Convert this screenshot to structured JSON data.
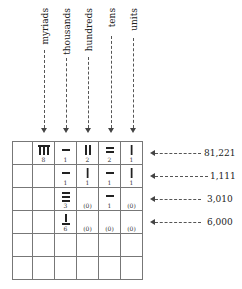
{
  "columns": [
    {
      "label": "myriads",
      "x": 43
    },
    {
      "label": "thousands",
      "x": 63
    },
    {
      "label": "hundreds",
      "x": 86
    },
    {
      "label": "tens",
      "x": 109
    },
    {
      "label": "units",
      "x": 131
    }
  ],
  "rows": [
    {
      "value": "81,221",
      "cells": [
        {
          "rod": "8",
          "digit": "8"
        },
        {
          "rod": "1h",
          "digit": "1"
        },
        {
          "rod": "2v",
          "digit": "2"
        },
        {
          "rod": "2h",
          "digit": "2"
        },
        {
          "rod": "1v",
          "digit": "1"
        }
      ]
    },
    {
      "value": "1,111",
      "cells": [
        {
          "rod": "",
          "digit": ""
        },
        {
          "rod": "1h",
          "digit": "1"
        },
        {
          "rod": "1v",
          "digit": "1"
        },
        {
          "rod": "1h",
          "digit": "1"
        },
        {
          "rod": "1v",
          "digit": "1"
        }
      ]
    },
    {
      "value": "3,010",
      "cells": [
        {
          "rod": "",
          "digit": ""
        },
        {
          "rod": "3h",
          "digit": "3"
        },
        {
          "rod": "",
          "digit": "(0)"
        },
        {
          "rod": "1h",
          "digit": "1"
        },
        {
          "rod": "",
          "digit": "(0)"
        }
      ]
    },
    {
      "value": "6,000",
      "cells": [
        {
          "rod": "",
          "digit": ""
        },
        {
          "rod": "6h",
          "digit": "6"
        },
        {
          "rod": "",
          "digit": "(0)"
        },
        {
          "rod": "",
          "digit": "(0)"
        },
        {
          "rod": "",
          "digit": "(0)"
        }
      ]
    },
    {
      "value": "",
      "cells": [
        {},
        {},
        {},
        {},
        {}
      ]
    },
    {
      "value": "",
      "cells": [
        {},
        {},
        {},
        {},
        {}
      ]
    }
  ]
}
